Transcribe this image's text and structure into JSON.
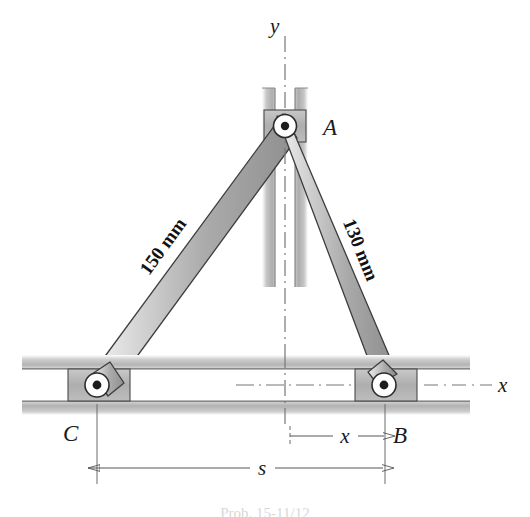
{
  "figure": {
    "background_color": "#ffffff",
    "labels": {
      "point_a": "A",
      "point_b": "B",
      "point_c": "C",
      "axis_y": "y",
      "axis_x": "x",
      "dim_x": "x",
      "dim_s": "s",
      "link_ac_length": "150 mm",
      "link_ab_length": "130 mm"
    },
    "caption": "Prob. 15-11/12"
  },
  "geometry": {
    "pivot_a": {
      "x": 285,
      "y": 126
    },
    "pivot_b": {
      "x": 384,
      "y": 385
    },
    "pivot_c": {
      "x": 97,
      "y": 385
    },
    "link_ac": {
      "from": "A",
      "to": "C",
      "label": "150 mm"
    },
    "link_ab": {
      "from": "A",
      "to": "B",
      "label": "130 mm"
    },
    "vertical_slot": {
      "center_x": 285,
      "top_y": 88,
      "bottom_y": 287
    },
    "horizontal_slot": {
      "center_y": 385,
      "left_x": 22,
      "right_x": 470
    },
    "dimension_x": {
      "from_x": 290,
      "to_x": 384,
      "y": 436
    },
    "dimension_s": {
      "from_x": 97,
      "to_x": 385,
      "y": 468
    }
  },
  "colors": {
    "link_fill_light": "#e9e9e9",
    "link_fill_mid": "#b8b8b8",
    "link_fill_dark": "#9a9a9a",
    "link_stroke": "#3a3a3a",
    "frame_fill": "#c3c3c3",
    "block_fill": "#b0b0b0",
    "outline": "#2e2e2e",
    "centerline": "#6b6b6b",
    "dimension_line": "#555555",
    "text": "#1a1a1a"
  }
}
